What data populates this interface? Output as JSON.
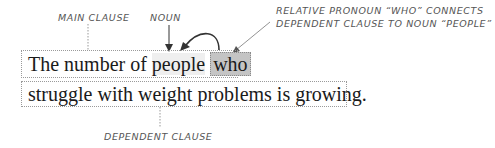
{
  "labels": {
    "main_clause": "MAIN CLAUSE",
    "noun": "NOUN",
    "relative_pronoun_line1": "RELATIVE PRONOUN “WHO” CONNECTS",
    "relative_pronoun_line2": "DEPENDENT CLAUSE TO NOUN “PEOPLE”",
    "dependent_clause": "DEPENDENT CLAUSE"
  },
  "sentence": {
    "line1_prefix": "The number of ",
    "line1_noun": "people",
    "line1_space": " ",
    "line1_pronoun": "who",
    "line2": "struggle with weight problems is growing."
  },
  "colors": {
    "pronoun_highlight": "#c4c4c4",
    "noun_highlight": "#efefef",
    "annotation_text": "#555555",
    "dotted_border": "#9a9a9a"
  }
}
